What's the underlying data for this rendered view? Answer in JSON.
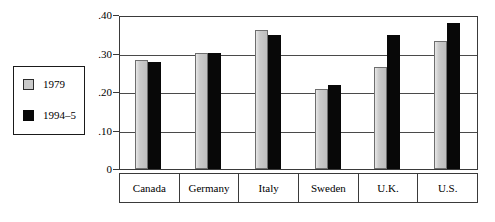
{
  "chart_data": {
    "type": "bar",
    "title": "",
    "subtitle": "",
    "xlabel": "",
    "ylabel": "",
    "categories": [
      "Canada",
      "Germany",
      "Italy",
      "Sweden",
      "U.K.",
      "U.S."
    ],
    "series": [
      {
        "name": "1979",
        "color": "#c9c9c9",
        "values": [
          0.282,
          0.302,
          0.36,
          0.209,
          0.266,
          0.332
        ]
      },
      {
        "name": "1994–5",
        "color": "#080808",
        "values": [
          0.278,
          0.302,
          0.347,
          0.219,
          0.349,
          0.379
        ]
      }
    ],
    "ylim": [
      0,
      0.4
    ],
    "yticks": [
      0,
      0.1,
      0.2,
      0.3,
      0.4
    ],
    "ytick_labels": [
      "0",
      ".10",
      ".20",
      ".30",
      ".40"
    ],
    "grid": true,
    "legend_position": "outside-left"
  },
  "legend": {
    "items": [
      {
        "label": "1979"
      },
      {
        "label": "1994–5"
      }
    ]
  },
  "colors": {
    "series_1979": "#c9c9c9",
    "series_1994_5": "#080808",
    "frame": "#3a3a3a",
    "gridline": "#4a4a4a",
    "background": "#ffffff"
  }
}
